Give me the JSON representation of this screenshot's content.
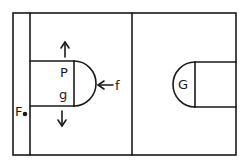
{
  "diagram": {
    "type": "court-diagram",
    "labels": {
      "p": "P",
      "g": "g",
      "f": "f",
      "F": "F",
      "G": "G"
    },
    "arrows": [
      {
        "name": "up-arrow",
        "direction": "up",
        "from_label": "P"
      },
      {
        "name": "down-arrow",
        "direction": "down",
        "from_label": "g"
      },
      {
        "name": "left-arrow",
        "direction": "left",
        "from_label": "f"
      }
    ],
    "markers": [
      {
        "name": "player-dot",
        "label": "F"
      }
    ],
    "colors": {
      "line": "#1a1a1a",
      "background": "#ffffff"
    }
  }
}
